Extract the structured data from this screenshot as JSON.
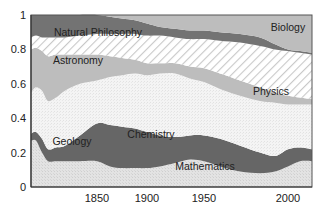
{
  "chart_data": {
    "type": "area",
    "stacked": true,
    "normalized": true,
    "title": "",
    "xlabel": "",
    "ylabel": "",
    "ylim": [
      0,
      1
    ],
    "xlim": [
      1800,
      2005
    ],
    "grid": false,
    "legend": "inline labels",
    "y_ticks": [
      "0",
      "0.2",
      "0.4",
      "0.6",
      "0.8",
      "1"
    ],
    "y_tick_values": [
      0,
      0.2,
      0.4,
      0.6,
      0.8,
      1
    ],
    "x_ticks": [
      "1850",
      "1900",
      "1950",
      "2000"
    ],
    "x_tick_pixels": [
      97,
      147,
      204,
      288
    ],
    "x_sample_pixels": [
      31,
      36,
      42,
      48,
      56,
      65,
      80,
      97,
      110,
      122,
      135,
      147,
      160,
      175,
      190,
      204,
      220,
      240,
      260,
      275,
      288,
      300,
      312
    ],
    "series": [
      {
        "name": "Mathematics",
        "label_pos": [
          205,
          170
        ],
        "color": "#e4e4e4",
        "pattern": "stipple",
        "top": [
          0.27,
          0.27,
          0.2,
          0.15,
          0.15,
          0.15,
          0.15,
          0.15,
          0.12,
          0.11,
          0.11,
          0.11,
          0.12,
          0.14,
          0.16,
          0.15,
          0.12,
          0.09,
          0.08,
          0.09,
          0.12,
          0.15,
          0.15
        ]
      },
      {
        "name": "Geology",
        "label_pos": [
          72,
          145
        ],
        "color": "#666666",
        "pattern": "solid",
        "top": [
          0.31,
          0.32,
          0.28,
          0.22,
          0.23,
          0.24,
          0.3,
          0.37,
          0.36,
          0.35,
          0.34,
          0.32,
          0.3,
          0.29,
          0.3,
          0.3,
          0.28,
          0.24,
          0.2,
          0.18,
          0.22,
          0.23,
          0.22
        ]
      },
      {
        "name": "Chemistry",
        "label_pos": [
          151,
          138
        ],
        "color": "#f2f2f2",
        "pattern": "stipple",
        "top": [
          0.55,
          0.58,
          0.56,
          0.5,
          0.52,
          0.56,
          0.6,
          0.62,
          0.64,
          0.65,
          0.66,
          0.65,
          0.66,
          0.66,
          0.63,
          0.61,
          0.57,
          0.53,
          0.5,
          0.49,
          0.48,
          0.48,
          0.48
        ]
      },
      {
        "name": "Astronomy",
        "label_pos": [
          78,
          64
        ],
        "color": "#bdbdbd",
        "pattern": "solid",
        "top": [
          0.8,
          0.81,
          0.79,
          0.76,
          0.77,
          0.77,
          0.77,
          0.77,
          0.76,
          0.75,
          0.74,
          0.72,
          0.72,
          0.72,
          0.7,
          0.69,
          0.66,
          0.62,
          0.58,
          0.55,
          0.53,
          0.52,
          0.51
        ]
      },
      {
        "name": "Physics",
        "label_pos": [
          271,
          95
        ],
        "color": "#ffffff",
        "pattern": "hatch",
        "top": [
          0.87,
          0.88,
          0.87,
          0.87,
          0.87,
          0.87,
          0.88,
          0.89,
          0.89,
          0.89,
          0.89,
          0.88,
          0.88,
          0.87,
          0.86,
          0.86,
          0.85,
          0.84,
          0.82,
          0.8,
          0.79,
          0.78,
          0.77
        ]
      },
      {
        "name": "Natural Philosophy",
        "label_pos": [
          98,
          36
        ],
        "color": "#737373",
        "pattern": "solid",
        "top": [
          1.0,
          1.0,
          1.0,
          1.0,
          1.0,
          1.0,
          1.0,
          1.0,
          0.99,
          0.98,
          0.97,
          0.95,
          0.93,
          0.92,
          0.91,
          0.91,
          0.9,
          0.89,
          0.87,
          0.83,
          0.8,
          0.79,
          0.78
        ]
      },
      {
        "name": "Biology",
        "label_pos": [
          288,
          31
        ],
        "color": "#bdbdbd",
        "pattern": "solid",
        "top": [
          1.0,
          1.0,
          1.0,
          1.0,
          1.0,
          1.0,
          1.0,
          1.0,
          1.0,
          1.0,
          1.0,
          1.0,
          1.0,
          1.0,
          1.0,
          1.0,
          1.0,
          1.0,
          1.0,
          1.0,
          1.0,
          1.0,
          1.0
        ]
      }
    ]
  }
}
